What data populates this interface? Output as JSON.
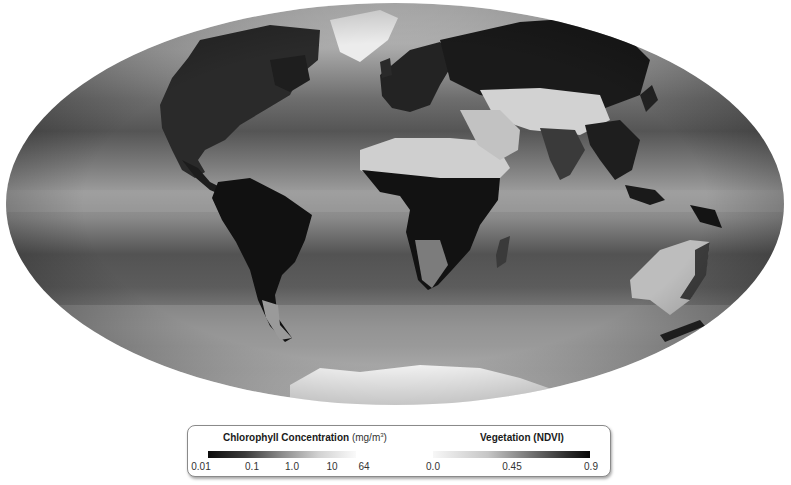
{
  "map": {
    "projection": "Mollweide (elliptical world map)",
    "description": "Global composite: ocean chlorophyll concentration and land vegetation (NDVI), grayscale",
    "colors": {
      "ocean_low": "#4a4a4a",
      "ocean_mid": "#7e7e7e",
      "ocean_high": "#b8b8b8",
      "land_dense_vegetation": "#141414",
      "land_sparse": "#d6d6d6",
      "ice": "#f2f2f2"
    }
  },
  "legend": {
    "chlorophyll": {
      "title": "Chlorophyll Concentration",
      "unit_prefix": "(mg/m",
      "unit_sup": "3",
      "unit_suffix": ")",
      "ticks": [
        "0.01",
        "0.1",
        "1.0",
        "10",
        "64"
      ]
    },
    "vegetation": {
      "title": "Vegetation (NDVI)",
      "ticks": [
        "0.0",
        "0.45",
        "0.9"
      ]
    }
  }
}
